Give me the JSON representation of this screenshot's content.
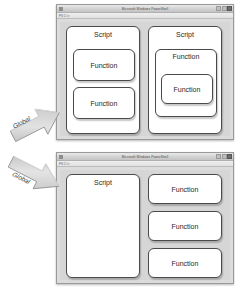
{
  "page": {
    "background": "#ffffff",
    "accent_shape_fill": "#ffffff",
    "window_chrome_color": "#dcdcdc",
    "arrow_color": "#c9c9c9"
  },
  "windows": [
    {
      "id": "window-top",
      "title": "Microsoft Windows PowerShell",
      "toolbar_text": "PS C:\\>",
      "controls": {
        "minimize": "minimize-button",
        "maximize": "maximize-button",
        "close": "close-button"
      },
      "shapes": [
        {
          "name": "script-box-left",
          "label": "Script",
          "children": [
            {
              "name": "function-box",
              "label": "Function"
            },
            {
              "name": "function-box",
              "label": "Function"
            }
          ]
        },
        {
          "name": "script-box-right",
          "label": "Script",
          "children": [
            {
              "name": "function-box-outer",
              "label": "Function",
              "children": [
                {
                  "name": "function-box-nested",
                  "label": "Function"
                }
              ]
            }
          ]
        }
      ]
    },
    {
      "id": "window-bottom",
      "title": "Microsoft Windows PowerShell",
      "toolbar_text": "PS C:\\>",
      "controls": {
        "minimize": "minimize-button",
        "maximize": "maximize-button",
        "close": "close-button"
      },
      "shapes": [
        {
          "name": "script-box",
          "label": "Script",
          "children": []
        },
        {
          "name": "function-box",
          "label": "Function"
        },
        {
          "name": "function-box",
          "label": "Function"
        }
      ],
      "extra_function": {
        "name": "function-box",
        "label": "Function"
      }
    }
  ],
  "arrows": [
    {
      "name": "global-arrow-up",
      "label": "Global",
      "direction": "up-right"
    },
    {
      "name": "global-arrow-down",
      "label": "Global",
      "direction": "down-right"
    }
  ]
}
